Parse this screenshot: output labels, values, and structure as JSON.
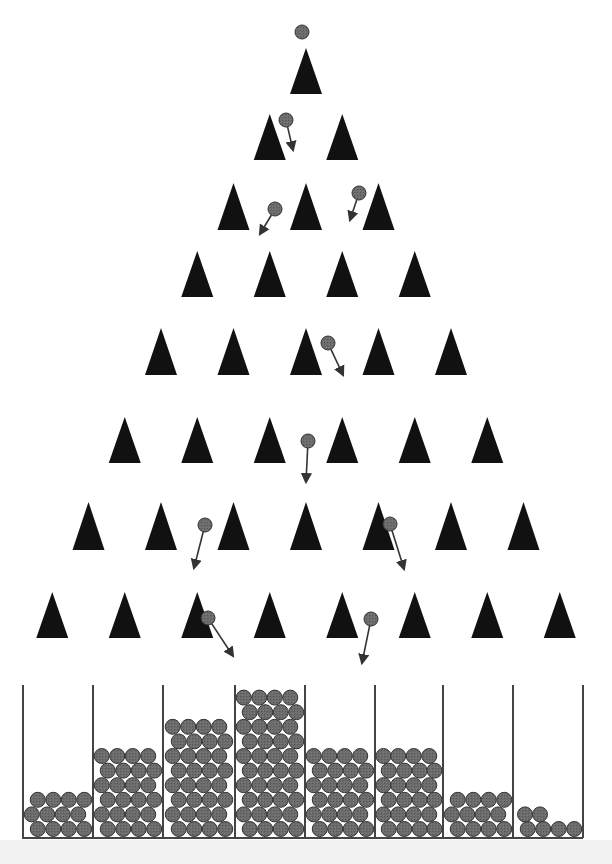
{
  "diagram": {
    "title": "",
    "type": "galton-board",
    "colors": {
      "peg": "#111111",
      "ball_fill": "#6e6e6e",
      "ball_stroke": "#333333",
      "arrow": "#333333",
      "bin_wall": "#444444",
      "background": "#ffffff"
    },
    "peg_rows": [
      {
        "row": 1,
        "y_top": 48,
        "y_base": 94,
        "count": 1
      },
      {
        "row": 2,
        "y_top": 114,
        "y_base": 160,
        "count": 2
      },
      {
        "row": 3,
        "y_top": 183,
        "y_base": 230,
        "count": 3
      },
      {
        "row": 4,
        "y_top": 251,
        "y_base": 297,
        "count": 4
      },
      {
        "row": 5,
        "y_top": 328,
        "y_base": 375,
        "count": 5
      },
      {
        "row": 6,
        "y_top": 417,
        "y_base": 463,
        "count": 6
      },
      {
        "row": 7,
        "y_top": 502,
        "y_base": 550,
        "count": 7
      },
      {
        "row": 8,
        "y_top": 592,
        "y_base": 638,
        "count": 8
      }
    ],
    "falling_balls": [
      {
        "cx": 302,
        "cy": 32,
        "arrow": null
      },
      {
        "cx": 286,
        "cy": 120,
        "arrow": [
          293,
          150
        ]
      },
      {
        "cx": 275,
        "cy": 209,
        "arrow": [
          260,
          234
        ]
      },
      {
        "cx": 359,
        "cy": 193,
        "arrow": [
          350,
          220
        ]
      },
      {
        "cx": 328,
        "cy": 343,
        "arrow": [
          343,
          375
        ]
      },
      {
        "cx": 308,
        "cy": 441,
        "arrow": [
          306,
          482
        ]
      },
      {
        "cx": 205,
        "cy": 525,
        "arrow": [
          194,
          568
        ]
      },
      {
        "cx": 390,
        "cy": 524,
        "arrow": [
          404,
          569
        ]
      },
      {
        "cx": 208,
        "cy": 618,
        "arrow": [
          233,
          656
        ]
      },
      {
        "cx": 371,
        "cy": 619,
        "arrow": [
          362,
          663
        ]
      }
    ],
    "bins": {
      "walls_x": [
        23,
        93,
        163,
        235,
        305,
        375,
        443,
        513
      ],
      "wall_top_y": 685,
      "floor_y": 838,
      "counts": [
        12,
        23,
        31,
        40,
        24,
        23,
        11,
        6
      ],
      "rows_filled": [
        3,
        6,
        8,
        10,
        6,
        6,
        3,
        2
      ]
    }
  },
  "chart_data": {
    "type": "bar",
    "categories": [
      "Bin 1",
      "Bin 2",
      "Bin 3",
      "Bin 4",
      "Bin 5",
      "Bin 6",
      "Bin 7",
      "Bin 8"
    ],
    "values": [
      12,
      23,
      31,
      40,
      24,
      23,
      11,
      6
    ],
    "xlabel": "",
    "ylabel": "",
    "grid": false
  }
}
